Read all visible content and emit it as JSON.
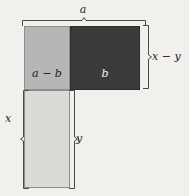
{
  "figure": {
    "background_color": "#f2f0ec",
    "regions": [
      {
        "name": "a-minus-b",
        "label": "a − b",
        "fill": "#b6b6b6",
        "stroke": "#8d8d8d",
        "text_color": "#1a1a1a"
      },
      {
        "name": "b",
        "label": "b",
        "fill": "#3a3a3a",
        "stroke": "#2b2b2b",
        "text_color": "#f2f0ec"
      },
      {
        "name": "y-column",
        "label": "",
        "fill": "#dcdad6",
        "stroke": "#8d8d8d",
        "text_color": "#1a1a1a"
      }
    ],
    "dimensions": [
      {
        "name": "top-width",
        "label": "a",
        "position": "top",
        "icon": "brace-bracket-icon"
      },
      {
        "name": "right-height-upper",
        "label": "x − y",
        "position": "right",
        "icon": "brace-bracket-icon"
      },
      {
        "name": "left-height-total",
        "label": "x",
        "position": "left",
        "icon": "brace-bracket-icon"
      },
      {
        "name": "inner-height-lower",
        "label": "y",
        "position": "inner-right",
        "icon": "brace-bracket-icon"
      }
    ]
  }
}
